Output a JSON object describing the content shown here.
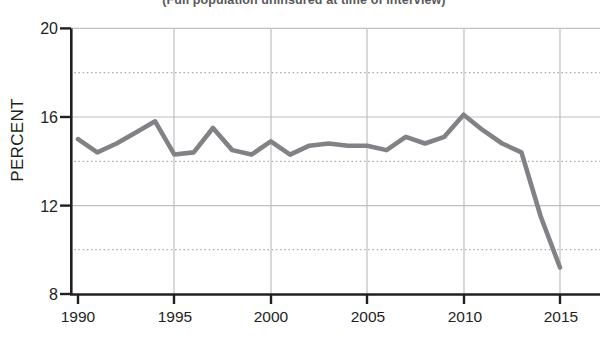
{
  "chart_data": {
    "type": "line",
    "title": "(Full population uninsured at time of interview)",
    "xlabel": "",
    "ylabel": "PERCENT",
    "xlim": [
      1990,
      2015
    ],
    "ylim": [
      8,
      20
    ],
    "grid": true,
    "legend": "none",
    "line_color": "#808285",
    "x_ticks": [
      "1990",
      "1995",
      "2000",
      "2005",
      "2010",
      "2015"
    ],
    "y_ticks": [
      "8",
      "12",
      "16",
      "20"
    ],
    "y_gridlines_major": [
      12,
      16,
      20
    ],
    "y_gridlines_minor": [
      10,
      14,
      18
    ],
    "x": [
      1990,
      1991,
      1992,
      1993,
      1994,
      1995,
      1996,
      1997,
      1998,
      1999,
      2000,
      2001,
      2002,
      2003,
      2004,
      2005,
      2006,
      2007,
      2008,
      2009,
      2010,
      2011,
      2012,
      2013,
      2014,
      2015
    ],
    "values": [
      15.0,
      14.4,
      14.8,
      15.3,
      15.8,
      14.3,
      14.4,
      15.5,
      14.5,
      14.3,
      14.9,
      14.3,
      14.7,
      14.8,
      14.7,
      14.7,
      14.5,
      15.1,
      14.8,
      15.1,
      16.1,
      15.4,
      14.8,
      14.4,
      11.5,
      9.2
    ],
    "series": [
      {
        "name": "Uninsured",
        "values": [
          15.0,
          14.4,
          14.8,
          15.3,
          15.8,
          14.3,
          14.4,
          15.5,
          14.5,
          14.3,
          14.9,
          14.3,
          14.7,
          14.8,
          14.7,
          14.7,
          14.5,
          15.1,
          14.8,
          15.1,
          16.1,
          15.4,
          14.8,
          14.4,
          11.5,
          9.2
        ]
      }
    ]
  },
  "axes": {
    "y_label": "PERCENT",
    "y_tick_20": "20",
    "y_tick_16": "16",
    "y_tick_12": "12",
    "y_tick_8": "8",
    "x_tick_1990": "1990",
    "x_tick_1995": "1995",
    "x_tick_2000": "2000",
    "x_tick_2005": "2005",
    "x_tick_2010": "2010",
    "x_tick_2015": "2015"
  },
  "header": {
    "title": "(Full population uninsured at time of interview)"
  }
}
